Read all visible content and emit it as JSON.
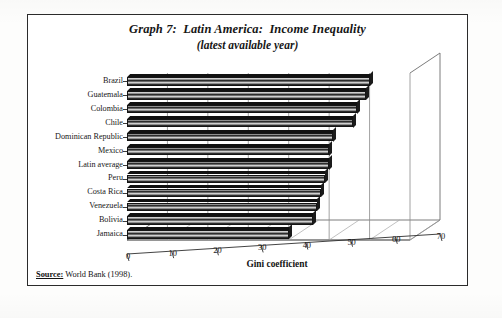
{
  "figure": {
    "title_line1": "Graph 7:  Latin America:  Income Inequality",
    "title_line2": "(latest available year)",
    "source_label": "Source:",
    "source_text": " World Bank (1998)."
  },
  "chart_data": {
    "type": "bar",
    "orientation": "horizontal",
    "title": "Graph 7:  Latin America:  Income Inequality",
    "subtitle": "(latest available year)",
    "xlabel": "Gini coefficient",
    "ylabel": "",
    "xlim": [
      0,
      70
    ],
    "xticks": [
      0,
      10,
      20,
      30,
      40,
      50,
      60,
      70
    ],
    "grid": true,
    "grid_axis": "x",
    "legend": false,
    "style": "3d-bar",
    "source": "World Bank (1998).",
    "categories": [
      "Brazil",
      "Guatemala",
      "Colombia",
      "Chile",
      "Dominican Republic",
      "Mexico",
      "Latin average",
      "Peru",
      "Costa Rica",
      "Venezuela",
      "Bolivia",
      "Jamaica"
    ],
    "values": [
      60,
      59,
      57,
      56,
      51,
      50,
      50,
      49,
      48,
      47,
      46,
      40
    ]
  }
}
